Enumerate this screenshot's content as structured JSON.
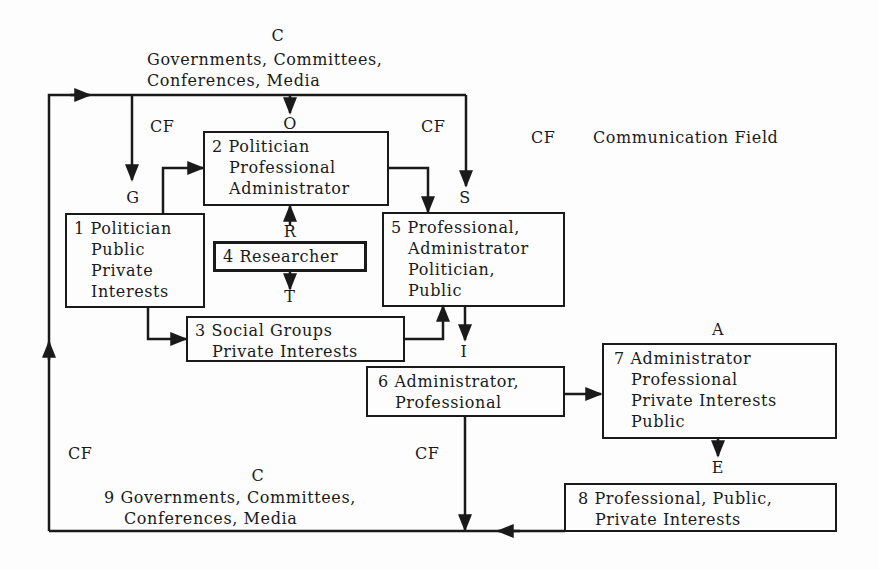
{
  "diagram": {
    "legend": {
      "abbr": "CF",
      "text": "Communication Field"
    },
    "top_node": {
      "letter": "C",
      "line1": "Governments, Committees,",
      "line2": "Conferences, Media"
    },
    "link_letters": {
      "O": "O",
      "G": "G",
      "S": "S",
      "R": "R",
      "T": "T",
      "I": "I",
      "A": "A",
      "E": "E",
      "C_bottom": "C"
    },
    "cf_labels": [
      "CF",
      "CF",
      "CF",
      "CF"
    ],
    "boxes": [
      {
        "id": 1,
        "lines": [
          "1 Politician",
          "Public",
          "Private",
          "Interests"
        ]
      },
      {
        "id": 2,
        "lines": [
          "2 Politician",
          "Professional",
          "Administrator"
        ]
      },
      {
        "id": 3,
        "lines": [
          "3 Social Groups",
          "Private Interests"
        ]
      },
      {
        "id": 4,
        "lines": [
          "4 Researcher"
        ]
      },
      {
        "id": 5,
        "lines": [
          "5 Professional,",
          "Administrator",
          "Politician,",
          "Public"
        ]
      },
      {
        "id": 6,
        "lines": [
          "6 Administrator,",
          "Professional"
        ]
      },
      {
        "id": 7,
        "lines": [
          "7 Administrator",
          "Professional",
          "Private Interests",
          "Public"
        ]
      },
      {
        "id": 8,
        "lines": [
          "8 Professional, Public,",
          "Private Interests"
        ]
      }
    ],
    "bottom_node": {
      "line1": "9 Governments, Committees,",
      "line2": "Conferences, Media"
    },
    "colors": {
      "ink": "#1a1a1a",
      "paper": "#fdfdfd"
    }
  }
}
